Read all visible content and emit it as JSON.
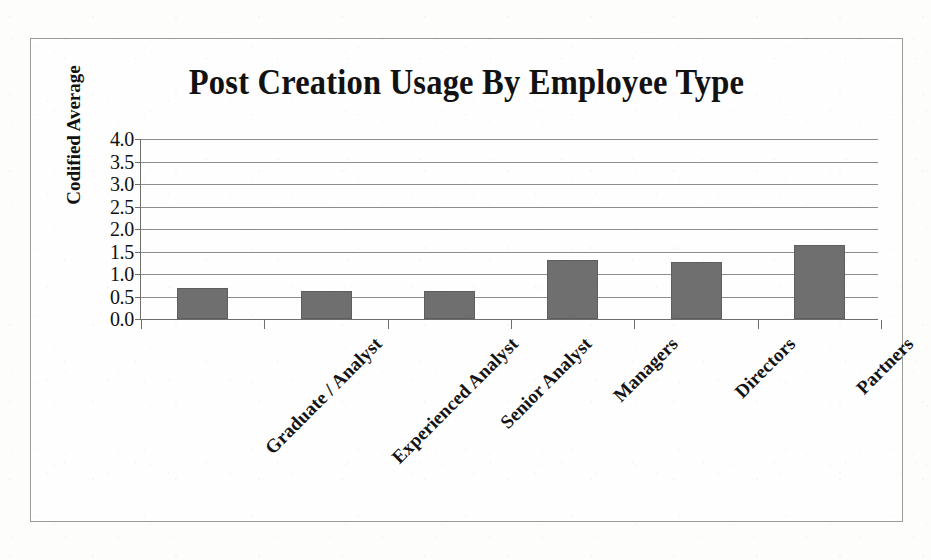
{
  "chart_data": {
    "type": "bar",
    "title": "Post Creation Usage By Employee Type",
    "xlabel": "",
    "ylabel": "Codified Average",
    "categories": [
      "Graduate / Analyst",
      "Experienced Analyst",
      "Senior Analyst",
      "Managers",
      "Directors",
      "Partners"
    ],
    "values": [
      0.69,
      0.62,
      0.62,
      1.31,
      1.26,
      1.65
    ],
    "ylim": [
      0.0,
      4.0
    ],
    "ytick_labels": [
      "4.0",
      "3.5",
      "3.0",
      "2.5",
      "2.0",
      "1.5",
      "1.0",
      "0.5",
      "0.0"
    ],
    "ytick_values": [
      4.0,
      3.5,
      3.0,
      2.5,
      2.0,
      1.5,
      1.0,
      0.5,
      0.0
    ],
    "ytick_step": 0.5,
    "grid": true,
    "legend": false,
    "bar_color": "#6f6f6f",
    "gridline_color": "#8d8d8d",
    "axis_color": "#6d6d6d",
    "border_color": "#9a9a9a",
    "background_color": "#fefefe",
    "title_color": "#121212",
    "label_rotation_deg": -45
  }
}
